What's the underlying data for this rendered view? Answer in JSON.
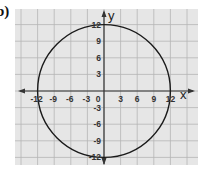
{
  "problem_label": "b)",
  "chart_data": {
    "type": "line",
    "title": "",
    "shape": {
      "kind": "circle",
      "center": [
        0,
        0
      ],
      "radius": 12
    },
    "xlabel": "x",
    "ylabel": "y",
    "xlim": [
      -15,
      15
    ],
    "ylim": [
      -15,
      15
    ],
    "grid": true,
    "grid_step": 3,
    "x_ticks": [
      -12,
      -9,
      -6,
      -3,
      0,
      3,
      6,
      9,
      12
    ],
    "y_ticks": [
      12,
      9,
      6,
      3,
      -3,
      -6,
      -9,
      -12
    ],
    "x_tick_labels": [
      "-12",
      "-9",
      "-6",
      "-3",
      "0",
      "3",
      "6",
      "9",
      "12"
    ],
    "y_tick_labels": [
      "12",
      "9",
      "6",
      "3",
      "-3",
      "-6",
      "-9",
      "-12"
    ],
    "intercepts": [
      [
        -12,
        0
      ],
      [
        12,
        0
      ],
      [
        0,
        12
      ],
      [
        0,
        -12
      ]
    ],
    "legend": null
  },
  "colors": {
    "grid_background": "#e6e6e6",
    "grid_lines": "#b5b5b5",
    "axes": "#333333",
    "curve": "#1a1a1a"
  }
}
